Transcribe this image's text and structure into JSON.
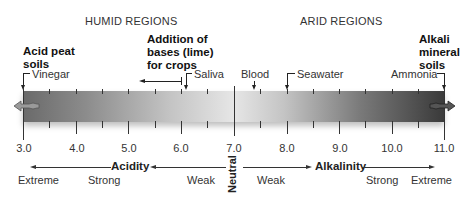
{
  "regions": {
    "humid": "HUMID REGIONS",
    "arid": "ARID REGIONS"
  },
  "annotations": {
    "acid_peat": [
      "Acid peat",
      "soils"
    ],
    "lime": [
      "Addition of",
      "bases (lime)",
      "for crops"
    ],
    "alkali": [
      "Alkali",
      "mineral",
      "soils"
    ]
  },
  "substances": {
    "vinegar": {
      "label": "Vinegar",
      "ph": 3.0
    },
    "saliva": {
      "label": "Saliva",
      "ph": 6.1
    },
    "blood": {
      "label": "Blood",
      "ph": 7.4
    },
    "seawater": {
      "label": "Seawater",
      "ph": 8.0
    },
    "ammonia": {
      "label": "Ammonia",
      "ph": 11.0
    }
  },
  "scale": {
    "min": 3.0,
    "max": 11.0,
    "ticks": [
      "3.0",
      "4.0",
      "5.0",
      "6.0",
      "7.0",
      "8.0",
      "9.0",
      "10.0",
      "11.0"
    ]
  },
  "bottom": {
    "acidity": "Acidity",
    "alkalinity": "Alkalinity",
    "neutral": "Neutral",
    "acid_extreme": "Extreme",
    "acid_strong": "Strong",
    "acid_weak": "Weak",
    "alk_weak": "Weak",
    "alk_strong": "Strong",
    "alk_extreme": "Extreme"
  },
  "colors": {
    "bar_dark": "#3a3a3a",
    "bar_light": "#e6e6e6",
    "text": "#333333"
  }
}
